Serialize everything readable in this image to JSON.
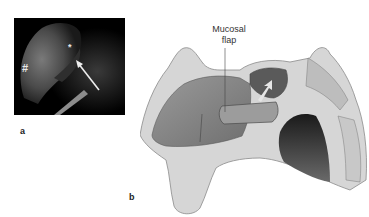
{
  "figure": {
    "panels": [
      {
        "label": "a",
        "kind": "endoscopic-image",
        "markers": {
          "hash": "#",
          "star": "*"
        },
        "annotation": "arrow"
      },
      {
        "label": "b",
        "kind": "sagittal-nasal-illustration",
        "callout": {
          "line1": "Mucosal",
          "line2": "flap"
        }
      }
    ],
    "colors": {
      "background": "#ffffff",
      "endoscope_bg": "#000000",
      "tissue": "#8a8a8a"
    }
  }
}
